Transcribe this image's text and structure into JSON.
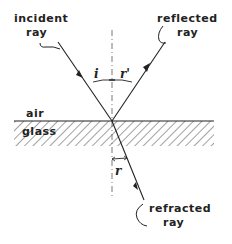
{
  "diagram": {
    "labels": {
      "incident_1": "incident",
      "incident_2": "ray",
      "reflected_1": "reflected",
      "reflected_2": "ray",
      "refracted_1": "refracted",
      "refracted_2": "ray",
      "air": "air",
      "glass": "glass",
      "angle_incidence": "i",
      "angle_reflection": "r'",
      "angle_refraction": "r"
    },
    "colors": {
      "ink": "#222222",
      "background": "#ffffff"
    }
  }
}
